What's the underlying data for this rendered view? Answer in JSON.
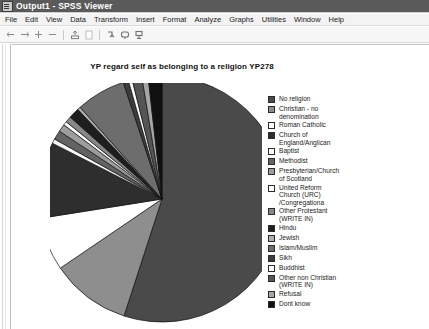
{
  "window": {
    "title": "Output1 - SPSS Viewer",
    "icon": "spss-output-icon"
  },
  "menubar": {
    "items": [
      {
        "label": "File"
      },
      {
        "label": "Edit"
      },
      {
        "label": "View"
      },
      {
        "label": "Data"
      },
      {
        "label": "Transform"
      },
      {
        "label": "Insert"
      },
      {
        "label": "Format"
      },
      {
        "label": "Analyze"
      },
      {
        "label": "Graphs"
      },
      {
        "label": "Utilities"
      },
      {
        "label": "Window"
      },
      {
        "label": "Help"
      }
    ]
  },
  "toolbar": {
    "items": [
      {
        "name": "back-arrow-icon",
        "glyph": "←"
      },
      {
        "name": "forward-arrow-icon",
        "glyph": "→"
      },
      {
        "name": "promote-plus-icon",
        "glyph": "+"
      },
      {
        "name": "demote-minus-icon",
        "glyph": "−"
      },
      {
        "name": "export-icon",
        "glyph": "↥"
      },
      {
        "name": "page-icon",
        "glyph": "▭"
      },
      {
        "name": "insert-heading-icon",
        "glyph": "⤵"
      },
      {
        "name": "insert-title-icon",
        "glyph": "⬜"
      },
      {
        "name": "insert-text-icon",
        "glyph": "⬚"
      }
    ]
  },
  "chart_data": {
    "type": "pie",
    "title": "YP regard self as belonging to a religion YP278",
    "xlabel": "",
    "ylabel": "",
    "legend_position": "right",
    "grid": false,
    "categories": [
      "No religion",
      "Christian - no\ndenomination",
      "Roman Catholic",
      "Church of\nEngland/Anglican",
      "Baptist",
      "Methodist",
      "Presbyterian/Church\nof Scotland",
      "United Reform\nChurch (URC)\n/Congregationa",
      "Other Protestant\n(WRITE IN)",
      "Hindu",
      "Jewish",
      "Islam/Muslim",
      "Sikh",
      "Buddhist",
      "Other non Christian\n(WRITE IN)",
      "Refusal",
      "Dont  know"
    ],
    "values": [
      55.0,
      10.5,
      7.0,
      10.0,
      0.6,
      1.2,
      1.0,
      0.5,
      0.8,
      1.4,
      0.4,
      6.5,
      0.7,
      0.5,
      1.3,
      0.8,
      1.8
    ],
    "colors": [
      "#4a4a4a",
      "#8e8e8e",
      "#ffffff",
      "#2e2e2e",
      "#fbfbfb",
      "#636363",
      "#9d9d9d",
      "#fdfdfd",
      "#888888",
      "#1e1e1e",
      "#b0b0b0",
      "#6d6d6d",
      "#3c3c3c",
      "#ffffff",
      "#555555",
      "#a6a6a6",
      "#111111"
    ]
  }
}
